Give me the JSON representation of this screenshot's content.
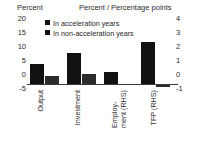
{
  "chart_data": {
    "type": "bar",
    "title": "",
    "subtitle": "",
    "header_left": "Percent",
    "header_right": "Percent / Percentage points",
    "xlabel": "",
    "ylabel": "Percent",
    "ylabel_right": "Percent / Percentage points",
    "categories": [
      "Output",
      "Investment",
      "Employ-\nment (RHS)",
      "TFP (RHS)"
    ],
    "category_axes": [
      "left",
      "left",
      "right",
      "right"
    ],
    "series": [
      {
        "name": "In acceleration years",
        "color": "#111111",
        "values": [
          8.0,
          12.3,
          1.0,
          3.25
        ],
        "values_left_scale": [
          8.0,
          12.3,
          5.0,
          16.2
        ]
      },
      {
        "name": "In non-acceleration years",
        "color": "#2c2c2c",
        "values": [
          3.5,
          4.0,
          0.02,
          -0.18
        ],
        "values_left_scale": [
          3.5,
          4.0,
          0.1,
          -0.9
        ]
      }
    ],
    "ylim": [
      -5,
      20
    ],
    "yticks": [
      "20",
      "15",
      "10",
      "5",
      "0",
      "-5"
    ],
    "ylim_right": [
      -1,
      4
    ],
    "yticks_right": [
      "4",
      "3",
      "2",
      "1",
      "0",
      "-1"
    ],
    "grid": false,
    "legend_position": "top-left"
  }
}
